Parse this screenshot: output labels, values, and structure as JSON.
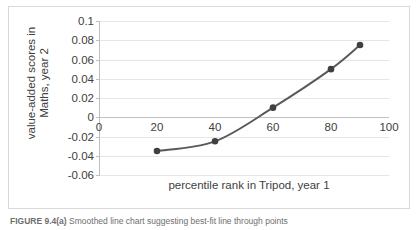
{
  "figure": {
    "caption_label": "FIGURE 9.4(a)",
    "caption_text": "Smoothed line chart suggesting best-fit line through points"
  },
  "chart_data": {
    "type": "line",
    "title": "",
    "xlabel": "percentile rank in Tripod, year 1",
    "ylabel": "value-added scores in\nMaths, year 2",
    "x": [
      20,
      40,
      60,
      80,
      90
    ],
    "values": [
      -0.035,
      -0.025,
      0.01,
      0.05,
      0.075
    ],
    "series": [
      {
        "name": "value-added score",
        "x": [
          20,
          40,
          60,
          80,
          90
        ],
        "values": [
          -0.035,
          -0.025,
          0.01,
          0.05,
          0.075
        ]
      }
    ],
    "xlim": [
      0,
      100
    ],
    "ylim": [
      -0.06,
      0.1
    ],
    "xticks": [
      0,
      20,
      40,
      60,
      80,
      100
    ],
    "xtick_labels": [
      "0",
      "20",
      "40",
      "60",
      "80",
      "100"
    ],
    "yticks": [
      0.1,
      0.08,
      0.06,
      0.04,
      0.02,
      0,
      -0.02,
      -0.04,
      -0.06
    ],
    "ytick_labels": [
      "0.1",
      "0.08",
      "0.06",
      "0.04",
      "0.02",
      "0",
      "-0.02",
      "-0.04",
      "-0.06"
    ],
    "grid": "horizontal",
    "legend": "none",
    "smoothed": true,
    "marker": "filled-circle",
    "line_color": "#595959",
    "marker_color": "#404040",
    "grid_color": "#e6e6e6",
    "axis_color": "#bfbfbf",
    "plot_background": "#ffffff"
  }
}
